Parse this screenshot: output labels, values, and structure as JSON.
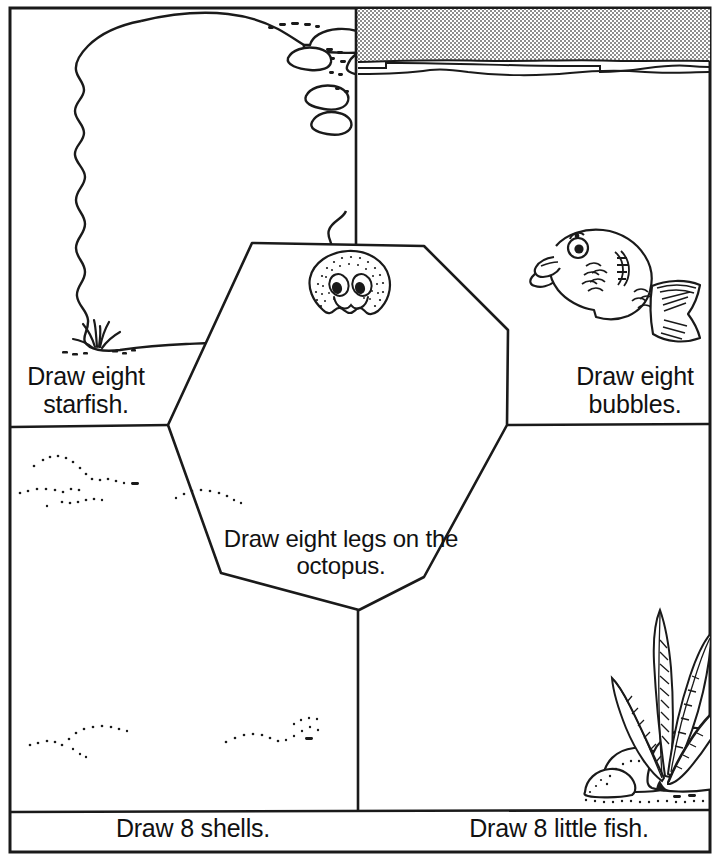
{
  "worksheet": {
    "title": "Draw eight legs on the octopus.",
    "theme": "ocean-counting-worksheet",
    "ink_color": "#111111",
    "paper_color": "#ffffff",
    "halftone_gray": "#9a9a9a"
  },
  "panels": {
    "top_left": {
      "name": "starfish-panel",
      "instruction": "Draw eight\nstarfish.",
      "scenery": "large-wavy-rock-outline-with-seaweed-tuft"
    },
    "top_right": {
      "name": "bubbles-panel",
      "instruction": "Draw eight\nbubbles.",
      "scenery": "gray-halftone-water-surface-band-with-wave-lines-and-cartoon-fish"
    },
    "bottom_left": {
      "name": "shells-panel",
      "instruction": "Draw 8 shells.",
      "scenery": "dotted-sand-ripple-arcs"
    },
    "bottom_right": {
      "name": "little-fish-panel",
      "instruction": "Draw 8 little fish.",
      "scenery": "seaweed-plant-on-rounded-rocks-with-dotted-sand"
    },
    "center": {
      "name": "octopus-panel",
      "instruction": "Draw eight legs on the\noctopus.",
      "scenery": "stippled-round-octopus-head-with-two-eyes-and-smile"
    }
  },
  "icons": {
    "octopus_head": "octopus-head-icon",
    "puffer_fish": "cartoon-fish-icon",
    "seaweed": "seaweed-plant-icon",
    "rocks": "rock-cluster-icon",
    "sand_ripples": "sand-ripple-icon",
    "water_surface": "water-surface-icon"
  }
}
